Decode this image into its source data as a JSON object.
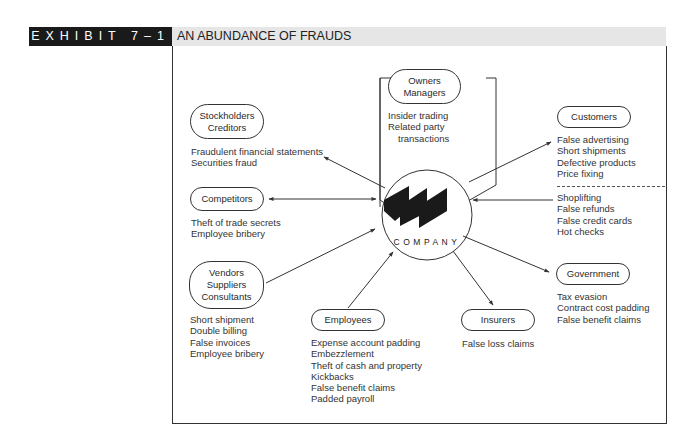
{
  "header": {
    "exhibit": "EXHIBIT 7–1",
    "title": "AN ABUNDANCE OF FRAUDS"
  },
  "center": {
    "label": "COMPANY",
    "logo_icon": "three-parallelogram-logo-icon"
  },
  "nodes": {
    "owners": {
      "lines": [
        "Owners",
        "Managers"
      ],
      "frauds": [
        "Insider trading",
        "Related party",
        "transactions"
      ]
    },
    "stockholders": {
      "lines": [
        "Stockholders",
        "Creditors"
      ],
      "frauds": [
        "Fraudulent financial statements",
        "Securities fraud"
      ]
    },
    "competitors": {
      "lines": [
        "Competitors"
      ],
      "frauds": [
        "Theft of trade secrets",
        "Employee bribery"
      ]
    },
    "vendors": {
      "lines": [
        "Vendors",
        "Suppliers",
        "Consultants"
      ],
      "frauds": [
        "Short shipment",
        "Double billing",
        "False invoices",
        "Employee bribery"
      ]
    },
    "employees": {
      "lines": [
        "Employees"
      ],
      "frauds": [
        "Expense account padding",
        "Embezzlement",
        "Theft of cash and property",
        "Kickbacks",
        "False benefit claims",
        "Padded payroll"
      ]
    },
    "insurers": {
      "lines": [
        "Insurers"
      ],
      "frauds": [
        "False loss claims"
      ]
    },
    "government": {
      "lines": [
        "Government"
      ],
      "frauds": [
        "Tax evasion",
        "Contract cost padding",
        "False benefit claims"
      ]
    },
    "customers": {
      "lines": [
        "Customers"
      ],
      "frauds_against_customers": [
        "False advertising",
        "Short shipments",
        "Defective products",
        "Price fixing"
      ],
      "frauds_by_customers": [
        "Shoplifting",
        "False refunds",
        "False credit cards",
        "Hot checks"
      ]
    }
  },
  "colors": {
    "exhibit_bg": "#1a1a1a",
    "title_bg": "#e6e6e6",
    "line": "#333333"
  }
}
